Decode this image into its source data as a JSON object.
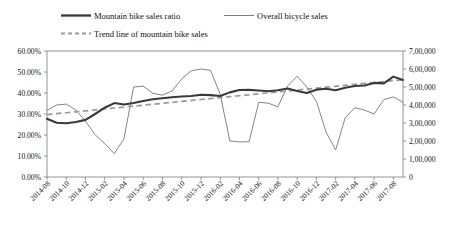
{
  "chart_data": {
    "type": "line",
    "title": "",
    "xlabel": "",
    "ylabel_left": "",
    "ylabel_right": "",
    "grid": false,
    "legend_position": "top",
    "categories": [
      "2014-08",
      "2014-09",
      "2014-10",
      "2014-11",
      "2014-12",
      "2015-01",
      "2015-02",
      "2015-03",
      "2015-04",
      "2015-05",
      "2015-06",
      "2015-07",
      "2015-08",
      "2015-09",
      "2015-10",
      "2015-11",
      "2015-12",
      "2016-01",
      "2016-02",
      "2016-03",
      "2016-04",
      "2016-05",
      "2016-06",
      "2016-07",
      "2016-08",
      "2016-09",
      "2016-10",
      "2016-11",
      "2016-12",
      "2017-01",
      "2017-02",
      "2017-03",
      "2017-04",
      "2017-05",
      "2017-06",
      "2017-07",
      "2017-08",
      "2017-09"
    ],
    "xtick_labels": [
      "2014-08",
      "2014-10",
      "2014-12",
      "2015-02",
      "2015-04",
      "2015-06",
      "2015-08",
      "2015-10",
      "2015-12",
      "2016-02",
      "2016-04",
      "2016-06",
      "2016-08",
      "2016-10",
      "2016-12",
      "2017-02",
      "2017-04",
      "2017-06",
      "2017-08"
    ],
    "ylim_left": [
      0,
      0.6
    ],
    "ytick_labels_left": [
      "0.00%",
      "10.00%",
      "20.00%",
      "30.00%",
      "40.00%",
      "50.00%",
      "60.00%"
    ],
    "ytick_values_left": [
      0,
      0.1,
      0.2,
      0.3,
      0.4,
      0.5,
      0.6
    ],
    "ylim_right": [
      0,
      700000
    ],
    "ytick_labels_right": [
      "0",
      "1,00,000",
      "2,00,000",
      "3,00,000",
      "4,00,000",
      "5,00,000",
      "6,00,000",
      "7,00,000"
    ],
    "ytick_values_right": [
      0,
      100000,
      200000,
      300000,
      400000,
      500000,
      600000,
      700000
    ],
    "series": [
      {
        "name": "Mountain bike sales ratio",
        "axis": "left",
        "style": "bold-solid",
        "color": "#3a3a3a",
        "values": [
          0.277,
          0.258,
          0.256,
          0.262,
          0.272,
          0.3,
          0.33,
          0.352,
          0.345,
          0.352,
          0.362,
          0.37,
          0.375,
          0.38,
          0.383,
          0.386,
          0.392,
          0.39,
          0.386,
          0.403,
          0.414,
          0.415,
          0.412,
          0.408,
          0.413,
          0.421,
          0.41,
          0.4,
          0.416,
          0.42,
          0.413,
          0.425,
          0.433,
          0.436,
          0.448,
          0.446,
          0.478,
          0.462
        ]
      },
      {
        "name": "Overall bicycle sales",
        "axis": "right",
        "style": "thin-solid",
        "color": "#6e6e6e",
        "values": [
          370000,
          400000,
          405000,
          372000,
          310000,
          235000,
          185000,
          130000,
          212000,
          500000,
          505000,
          465000,
          455000,
          478000,
          545000,
          590000,
          600000,
          592000,
          460000,
          200000,
          195000,
          196000,
          415000,
          410000,
          390000,
          505000,
          560000,
          500000,
          420000,
          250000,
          150000,
          330000,
          385000,
          372000,
          350000,
          430000,
          445000,
          415000
        ]
      },
      {
        "name": "Trend line of mountain bike sales",
        "axis": "left",
        "style": "dashed",
        "color": "#9a9a9a",
        "values": [
          0.297,
          0.3015,
          0.306,
          0.3105,
          0.315,
          0.3195,
          0.324,
          0.3285,
          0.333,
          0.3375,
          0.342,
          0.3465,
          0.351,
          0.3555,
          0.36,
          0.3645,
          0.369,
          0.3735,
          0.378,
          0.3825,
          0.387,
          0.3915,
          0.396,
          0.4005,
          0.405,
          0.4095,
          0.414,
          0.4185,
          0.423,
          0.4275,
          0.432,
          0.4365,
          0.441,
          0.4455,
          0.45,
          0.4545,
          0.459,
          0.4635
        ]
      }
    ]
  },
  "legend": {
    "items": [
      {
        "label": "Mountain bike sales ratio",
        "style": "bold-solid"
      },
      {
        "label": "Overall bicycle sales",
        "style": "thin-solid"
      },
      {
        "label": "Trend line of mountain bike sales",
        "style": "dashed"
      }
    ]
  }
}
